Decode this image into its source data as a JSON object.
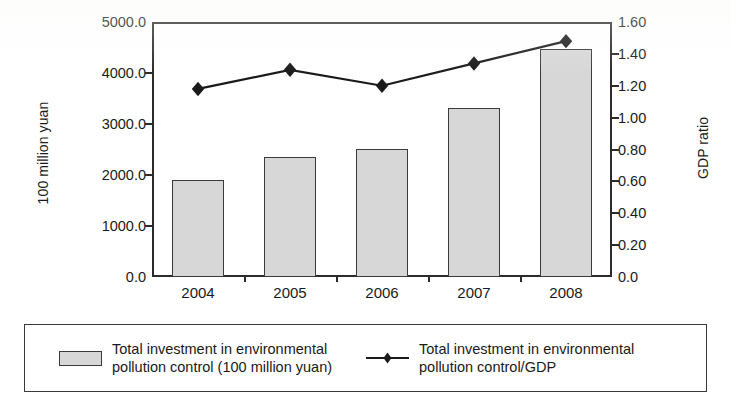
{
  "chart_data": {
    "type": "bar",
    "title": "",
    "subtitle": "",
    "xlabel": "",
    "ylabel": "100 million yuan",
    "y2label": "GDP ratio",
    "categories": [
      "2004",
      "2005",
      "2006",
      "2007",
      "2008"
    ],
    "ylim": [
      0,
      5000
    ],
    "y2lim": [
      0,
      1.6
    ],
    "grid": false,
    "legend_position": "bottom",
    "y_ticks": [
      "0.0",
      "1000.0",
      "2000.0",
      "3000.0",
      "4000.0",
      "5000.0"
    ],
    "y_tick_values": [
      0,
      1000,
      2000,
      3000,
      4000,
      5000
    ],
    "y2_ticks": [
      "0.0",
      "0.20",
      "0.40",
      "0.60",
      "0.80",
      "1.00",
      "1.20",
      "1.40",
      "1.60"
    ],
    "y2_tick_values": [
      0,
      0.2,
      0.4,
      0.6,
      0.8,
      1.0,
      1.2,
      1.4,
      1.6
    ],
    "series": [
      {
        "name": "Total investment in environmental pollution control (100 million yuan)",
        "type": "bar",
        "axis": "left",
        "values": [
          1900,
          2350,
          2510,
          3310,
          4470
        ],
        "color": "#d7d7d7",
        "edge_color": "#3a3a3a"
      },
      {
        "name": "Total investment in environmental pollution control/GDP",
        "type": "line",
        "axis": "right",
        "values": [
          1.18,
          1.3,
          1.2,
          1.34,
          1.48
        ],
        "color": "#1a1a1a",
        "marker": "diamond"
      }
    ]
  },
  "axes": {
    "left_title": "100 million yuan",
    "right_title": "GDP ratio"
  },
  "legend": {
    "entries": [
      {
        "swatch": "bar-swatch",
        "label": "Total investment in environmental\npollution control (100 million yuan)"
      },
      {
        "swatch": "line-marker-swatch",
        "label": "Total investment in environmental\npollution control/GDP"
      }
    ]
  },
  "colors": {
    "bar_fill": "#d7d7d7",
    "bar_edge": "#3a3a3a",
    "line": "#1a1a1a",
    "axis": "#2b2b2b",
    "text": "#1a1a1a",
    "background": "#ffffff"
  }
}
